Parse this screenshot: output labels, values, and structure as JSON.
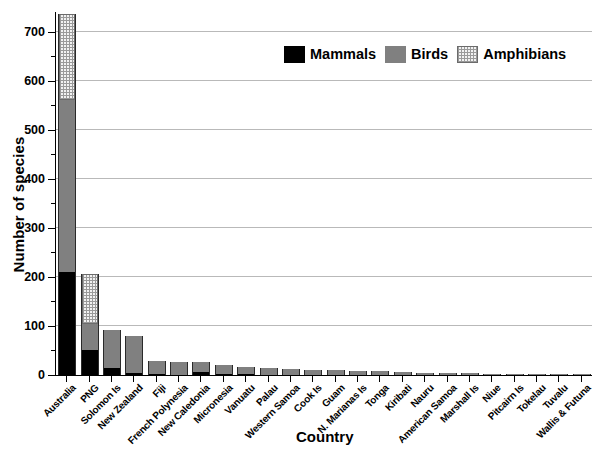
{
  "chart_data": {
    "type": "bar",
    "subtype": "stacked",
    "title": "",
    "xlabel": "Country",
    "ylabel": "Number of species",
    "ylim": [
      0,
      740
    ],
    "ytick_step": 100,
    "yminor_step": 50,
    "yticks": [
      0,
      100,
      200,
      300,
      400,
      500,
      600,
      700
    ],
    "grid": true,
    "grid_axis": "y",
    "legend_position": "top-center",
    "categories": [
      "Australia",
      "PNG",
      "Solomon Is",
      "New Zealand",
      "Fiji",
      "French Polynesia",
      "New Caledonia",
      "Micronesia",
      "Vanuatu",
      "Palau",
      "Western Samoa",
      "Cook Is",
      "Guam",
      "N. Marianas Is",
      "Tonga",
      "Kiribati",
      "Nauru",
      "American Samoa",
      "Marshall Is",
      "Niue",
      "Pitcairn Is",
      "Tokelau",
      "Tuvalu",
      "Wallis & Futuna"
    ],
    "series": [
      {
        "name": "Mammals",
        "color": "#000000",
        "values": [
          210,
          50,
          15,
          4,
          2,
          1,
          6,
          2,
          3,
          1,
          1,
          1,
          1,
          1,
          1,
          1,
          1,
          1,
          1,
          0,
          0,
          0,
          0,
          0
        ]
      },
      {
        "name": "Birds",
        "color": "#808080",
        "values": [
          350,
          55,
          77,
          76,
          26,
          26,
          20,
          19,
          14,
          13,
          11,
          10,
          9,
          8,
          7,
          5,
          4,
          4,
          3,
          3,
          3,
          2,
          2,
          2
        ]
      },
      {
        "name": "Amphibians",
        "color": "#f2f2f2",
        "pattern": "dotted",
        "values": [
          175,
          100,
          0,
          0,
          0,
          0,
          0,
          0,
          0,
          0,
          0,
          0,
          0,
          0,
          0,
          0,
          0,
          0,
          0,
          0,
          0,
          0,
          0,
          0
        ]
      }
    ],
    "totals": [
      735,
      205,
      92,
      80,
      28,
      27,
      26,
      21,
      17,
      14,
      12,
      11,
      10,
      9,
      8,
      6,
      5,
      5,
      4,
      3,
      3,
      2,
      2,
      2
    ]
  },
  "legend": {
    "items": [
      {
        "label": "Mammals",
        "swatch": "black-solid"
      },
      {
        "label": "Birds",
        "swatch": "gray-solid"
      },
      {
        "label": "Amphibians",
        "swatch": "light-dotted"
      }
    ]
  },
  "axes": {
    "y_title": "Number of species",
    "x_title": "Country"
  }
}
